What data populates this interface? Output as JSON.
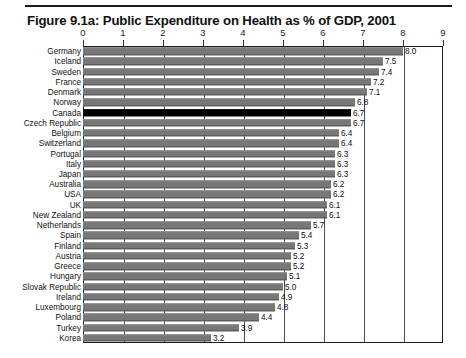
{
  "figure": {
    "title": "Figure 9.1a: Public Expenditure on Health as % of GDP, 2001"
  },
  "chart_data": {
    "type": "bar",
    "orientation": "horizontal",
    "title": "Figure 9.1a: Public Expenditure on Health as % of GDP, 2001",
    "xlabel": "",
    "ylabel": "",
    "xlim": [
      0,
      9
    ],
    "xticks": [
      "0",
      "1",
      "2",
      "3",
      "4",
      "5",
      "6",
      "7",
      "8",
      "9"
    ],
    "grid": true,
    "legend": "none",
    "highlight_category": "Canada",
    "highlight_color": "#000000",
    "bar_color": "#777777",
    "categories": [
      "Germany",
      "Iceland",
      "Sweden",
      "France",
      "Denmark",
      "Norway",
      "Canada",
      "Czech Republic",
      "Belgium",
      "Switzerland",
      "Portugal",
      "Italy",
      "Japan",
      "Australia",
      "USA",
      "UK",
      "New Zealand",
      "Netherlands",
      "Spain",
      "Finland",
      "Austria",
      "Greece",
      "Hungary",
      "Slovak Republic",
      "Ireland",
      "Luxembourg",
      "Poland",
      "Turkey",
      "Korea"
    ],
    "values": [
      8.0,
      7.5,
      7.4,
      7.2,
      7.1,
      6.8,
      6.7,
      6.7,
      6.4,
      6.4,
      6.3,
      6.3,
      6.3,
      6.2,
      6.2,
      6.1,
      6.1,
      5.7,
      5.4,
      5.3,
      5.2,
      5.2,
      5.1,
      5.0,
      4.9,
      4.8,
      4.4,
      3.9,
      3.2
    ],
    "value_labels": [
      "8.0",
      "7.5",
      "7.4",
      "7.2",
      "7.1",
      "6.8",
      "6.7",
      "6.7",
      "6.4",
      "6.4",
      "6.3",
      "6.3",
      "6.3",
      "6.2",
      "6.2",
      "6.1",
      "6.1",
      "5.7",
      "5.4",
      "5.3",
      "5.2",
      "5.2",
      "5.1",
      "5.0",
      "4.9",
      "4.8",
      "4.4",
      "3.9",
      "3.2"
    ]
  }
}
